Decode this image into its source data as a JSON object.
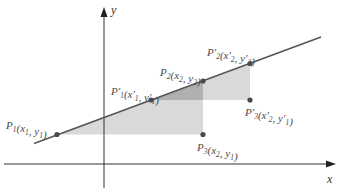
{
  "axes": {
    "x_label": "x",
    "y_label": "y"
  },
  "points": [
    {
      "id": "P1",
      "name": "P",
      "name_sub": "1",
      "prime": false,
      "coords": [
        {
          "v": "x",
          "sub": "1",
          "prime": false
        },
        {
          "v": "y",
          "sub": "1",
          "prime": false
        }
      ]
    },
    {
      "id": "P1p",
      "name": "P",
      "name_sub": "1",
      "prime": true,
      "coords": [
        {
          "v": "x",
          "sub": "1",
          "prime": true
        },
        {
          "v": "y",
          "sub": "1",
          "prime": true
        }
      ]
    },
    {
      "id": "P2",
      "name": "P",
      "name_sub": "2",
      "prime": false,
      "coords": [
        {
          "v": "x",
          "sub": "2",
          "prime": false
        },
        {
          "v": "y",
          "sub": "2",
          "prime": false
        }
      ]
    },
    {
      "id": "P2p",
      "name": "P",
      "name_sub": "2",
      "prime": true,
      "coords": [
        {
          "v": "x",
          "sub": "2",
          "prime": true
        },
        {
          "v": "y",
          "sub": "2",
          "prime": true
        }
      ]
    },
    {
      "id": "P3",
      "name": "P",
      "name_sub": "3",
      "prime": false,
      "coords": [
        {
          "v": "x",
          "sub": "2",
          "prime": false
        },
        {
          "v": "y",
          "sub": "1",
          "prime": false
        }
      ]
    },
    {
      "id": "P3p",
      "name": "P",
      "name_sub": "3",
      "prime": true,
      "coords": [
        {
          "v": "x",
          "sub": "2",
          "prime": true
        },
        {
          "v": "y",
          "sub": "1",
          "prime": true
        }
      ]
    }
  ],
  "triangles": [
    {
      "name": "triangle-p1-p2-p3",
      "vertices": [
        "P1",
        "P2",
        "P3"
      ]
    },
    {
      "name": "triangle-p1p-p2p-p3p",
      "vertices": [
        "P1p",
        "P2p",
        "P3p"
      ]
    }
  ],
  "colors": {
    "line": "#555555",
    "point": "#4a4a4a",
    "shade": "#d9d9d9",
    "overlap": "#b0b0b0",
    "axis": "#333333"
  }
}
